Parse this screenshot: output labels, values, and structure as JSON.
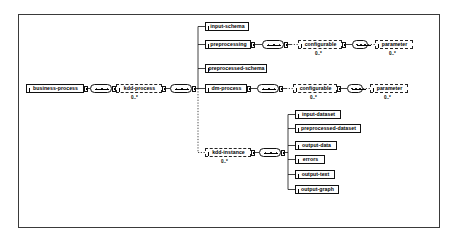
{
  "diagram": {
    "type": "xsd-schema-tree",
    "frame": {
      "border_color": "#3a3a3a",
      "background": "#ffffff"
    },
    "cardinality_label": "0..*",
    "nodes": [
      {
        "id": "business-process",
        "label": "business-process",
        "style": "solid",
        "x": 26,
        "y": 84,
        "w": 58,
        "has_expander": true,
        "cardinality": ""
      },
      {
        "id": "kdd-process",
        "label": "kdd-process",
        "style": "dashed",
        "x": 116,
        "y": 84,
        "w": 46,
        "has_expander": true,
        "cardinality": "0..*"
      },
      {
        "id": "input-schema",
        "label": "input-schema",
        "style": "solid",
        "x": 205,
        "y": 22,
        "w": 44,
        "has_expander": false,
        "cardinality": ""
      },
      {
        "id": "preprocessing",
        "label": "preprocessing",
        "style": "solid",
        "x": 205,
        "y": 40,
        "w": 46,
        "has_expander": true,
        "cardinality": ""
      },
      {
        "id": "preprocessed-schema",
        "label": "preprocessed-schema",
        "style": "solid",
        "x": 205,
        "y": 64,
        "w": 62,
        "has_expander": false,
        "cardinality": ""
      },
      {
        "id": "dm-process",
        "label": "dm-process",
        "style": "solid",
        "x": 205,
        "y": 84,
        "w": 42,
        "has_expander": true,
        "cardinality": ""
      },
      {
        "id": "configurable-top",
        "label": "configurable",
        "style": "dashed",
        "x": 298,
        "y": 40,
        "w": 44,
        "has_expander": true,
        "cardinality": "0..*"
      },
      {
        "id": "parameter-top",
        "label": "parameter",
        "style": "dashed",
        "x": 375,
        "y": 40,
        "w": 38,
        "has_expander": false,
        "cardinality": "0..*"
      },
      {
        "id": "configurable-bottom",
        "label": "configurable",
        "style": "dashed",
        "x": 293,
        "y": 84,
        "w": 44,
        "has_expander": true,
        "cardinality": "0..*"
      },
      {
        "id": "parameter-bottom",
        "label": "parameter",
        "style": "dashed",
        "x": 370,
        "y": 84,
        "w": 38,
        "has_expander": false,
        "cardinality": "0..*"
      },
      {
        "id": "kdd-instance",
        "label": "kdd-instance",
        "style": "dashed",
        "x": 205,
        "y": 148,
        "w": 46,
        "has_expander": true,
        "cardinality": "0..*"
      },
      {
        "id": "input-dataset",
        "label": "input-dataset",
        "style": "solid",
        "x": 295,
        "y": 110,
        "w": 46,
        "has_expander": false,
        "cardinality": ""
      },
      {
        "id": "preprocessed-dataset",
        "label": "preprocessed-dataset",
        "style": "solid",
        "x": 295,
        "y": 124,
        "w": 66,
        "has_expander": false,
        "cardinality": ""
      },
      {
        "id": "output-data",
        "label": "output-data",
        "style": "solid",
        "x": 295,
        "y": 141,
        "w": 42,
        "has_expander": false,
        "cardinality": ""
      },
      {
        "id": "errors",
        "label": "errors",
        "style": "solid",
        "x": 295,
        "y": 155,
        "w": 30,
        "has_expander": false,
        "cardinality": ""
      },
      {
        "id": "output-text",
        "label": "output-text",
        "style": "solid",
        "x": 295,
        "y": 170,
        "w": 40,
        "has_expander": false,
        "cardinality": ""
      },
      {
        "id": "output-graph",
        "label": "output-graph",
        "style": "solid",
        "x": 295,
        "y": 185,
        "w": 44,
        "has_expander": false,
        "cardinality": ""
      }
    ],
    "sequence_compositors": [
      {
        "id": "seq-business-process",
        "x": 90,
        "y": 84
      },
      {
        "id": "seq-kdd-process",
        "x": 170,
        "y": 84
      },
      {
        "id": "seq-preprocessing",
        "x": 262,
        "y": 40
      },
      {
        "id": "seq-dm-process",
        "x": 257,
        "y": 84
      },
      {
        "id": "seq-kdd-instance",
        "x": 259,
        "y": 148
      }
    ]
  }
}
